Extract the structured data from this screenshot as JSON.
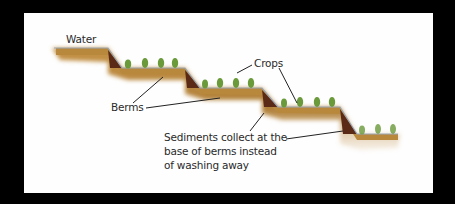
{
  "diagram": {
    "type": "terrace-farming-cross-section",
    "labels": {
      "water": "Water",
      "crops": "Crops",
      "berms": "Berms",
      "sediments_line1": "Sediments collect at the",
      "sediments_line2": "base of berms instead",
      "sediments_line3": "of washing away"
    },
    "colors": {
      "background": "#000000",
      "panel": "#fefefe",
      "soil": "#b8893e",
      "soil_dark": "#8a5a24",
      "sediment": "#5a2a14",
      "water_edge": "#9aa7b8",
      "crop": "#6a9a3a",
      "leader": "#222222"
    }
  }
}
